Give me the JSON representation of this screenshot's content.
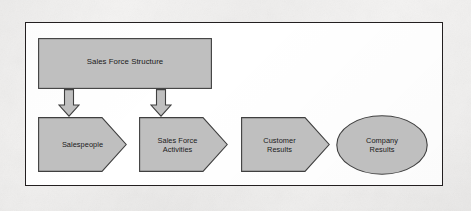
{
  "figure": {
    "kind": "flow-diagram",
    "nodes": {
      "structure": {
        "label": "Sales Force Structure",
        "shape": "rectangle"
      },
      "salespeople": {
        "label": "Salespeople",
        "shape": "chevron"
      },
      "activities": {
        "label": "Sales Force\nActivities",
        "shape": "chevron"
      },
      "customer_results": {
        "label": "Customer\nResults",
        "shape": "chevron"
      },
      "company_results": {
        "label": "Company\nResults",
        "shape": "ellipse"
      }
    },
    "connectors": [
      {
        "name": "structure-to-salespeople",
        "icon": "down-arrow-icon"
      },
      {
        "name": "structure-to-activities",
        "icon": "down-arrow-icon"
      }
    ],
    "colors": {
      "shape_fill": "#bfbfbf",
      "shape_stroke": "#3f3f3f",
      "frame_border": "#231f20",
      "frame_background": "#ffffff",
      "page_background": "#f4f3f2",
      "text": "#1a1a1a"
    }
  }
}
